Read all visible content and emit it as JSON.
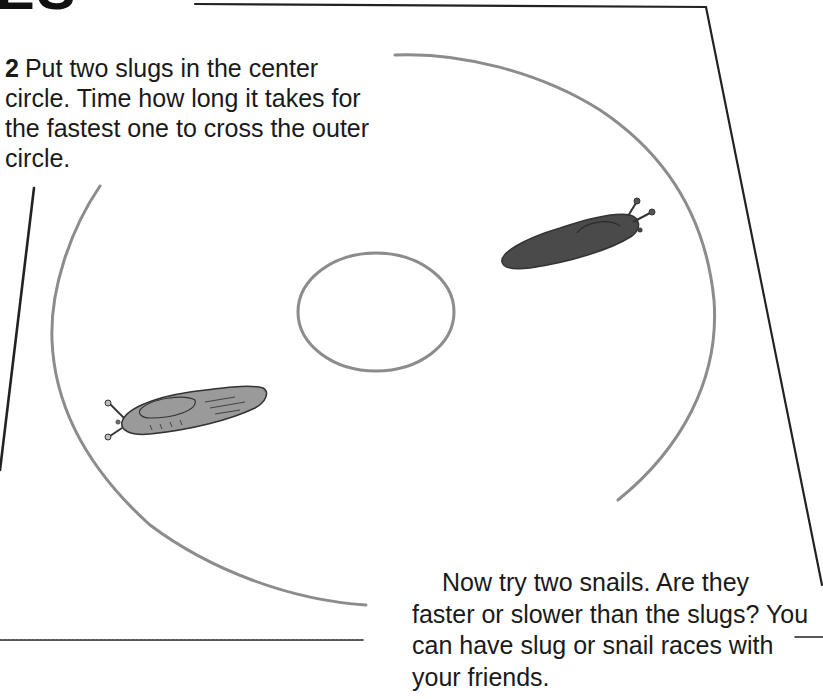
{
  "page": {
    "heading_fragment": "ES",
    "step": {
      "number": "2",
      "text": "Put two slugs in the center circle. Time how long it takes for the fastest one to cross the outer circle."
    },
    "closing": {
      "text": "Now try two snails. Are they faster or slower than the slugs? You can have slug or snail races with your friends."
    }
  },
  "illustration": {
    "board_line_color": "#222222",
    "circle_stroke_color": "#8c8c8c",
    "slug_dark_color": "#4a4a4a",
    "slug_light_color": "#9a9a9a",
    "elements": [
      "race-board",
      "outer-circle",
      "center-circle",
      "slug-dark",
      "slug-light"
    ]
  }
}
